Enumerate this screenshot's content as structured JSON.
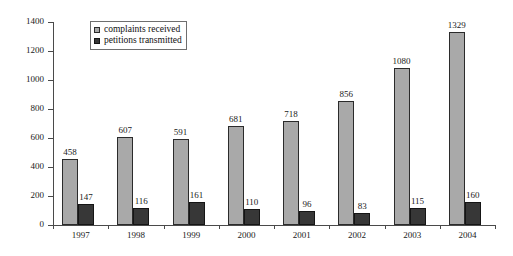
{
  "chart_data": {
    "type": "bar",
    "title": "",
    "subtitle": "",
    "xlabel": "",
    "ylabel": "",
    "categories": [
      "1997",
      "1998",
      "1999",
      "2000",
      "2001",
      "2002",
      "2003",
      "2004"
    ],
    "series": [
      {
        "name": "complaints received",
        "color": "#a9a9a9",
        "values": [
          458,
          607,
          591,
          681,
          718,
          856,
          1080,
          1329
        ]
      },
      {
        "name": "petitions transmitted",
        "color": "#373737",
        "values": [
          147,
          116,
          161,
          110,
          96,
          83,
          115,
          160
        ]
      }
    ],
    "ylim": [
      0,
      1400
    ],
    "yticks": [
      0,
      200,
      400,
      600,
      800,
      1000,
      1200,
      1400
    ],
    "ytick_labels": [
      "0",
      "200",
      "400",
      "600",
      "800",
      "1000",
      "1200",
      "1400"
    ],
    "grid": false,
    "legend_position": "top-center",
    "data_labels_shown": true
  },
  "legend": {
    "entries": [
      {
        "label": "complaints received",
        "swatch": "light-gray-square"
      },
      {
        "label": "petitions transmitted",
        "swatch": "dark-square"
      }
    ]
  }
}
